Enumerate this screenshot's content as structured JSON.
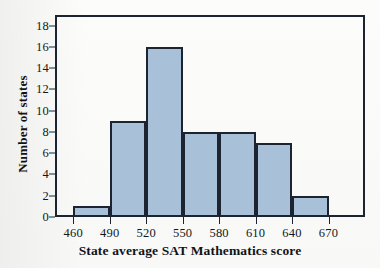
{
  "chart_data": {
    "type": "bar",
    "title": "",
    "subtitle": "",
    "xlabel": "State average SAT Mathematics score",
    "ylabel": "Number of states",
    "grid": false,
    "legend": null,
    "histogram": true,
    "bin_width": 30,
    "bin_edges": [
      460,
      490,
      520,
      550,
      580,
      610,
      640,
      670
    ],
    "categories": [
      "460-490",
      "490-520",
      "520-550",
      "550-580",
      "580-610",
      "610-640",
      "640-670"
    ],
    "values": [
      1,
      9,
      16,
      8,
      8,
      7,
      2
    ],
    "xlim": [
      445,
      700
    ],
    "ylim": [
      0,
      19
    ],
    "xticks": [
      460,
      490,
      520,
      550,
      580,
      610,
      640,
      670
    ],
    "yticks": [
      0,
      2,
      4,
      6,
      8,
      10,
      12,
      14,
      16,
      18
    ],
    "xtick_labels": [
      "460",
      "490",
      "520",
      "550",
      "580",
      "610",
      "640",
      "670"
    ],
    "ytick_labels": [
      "0",
      "2",
      "4",
      "6",
      "8",
      "10",
      "12",
      "14",
      "16",
      "18"
    ],
    "colors": {
      "bar_fill": "#a8c0d8",
      "bar_edge": "#1b2430",
      "axis": "#1b2430",
      "text": "#0f1318",
      "background": "#fdfdfc"
    }
  }
}
